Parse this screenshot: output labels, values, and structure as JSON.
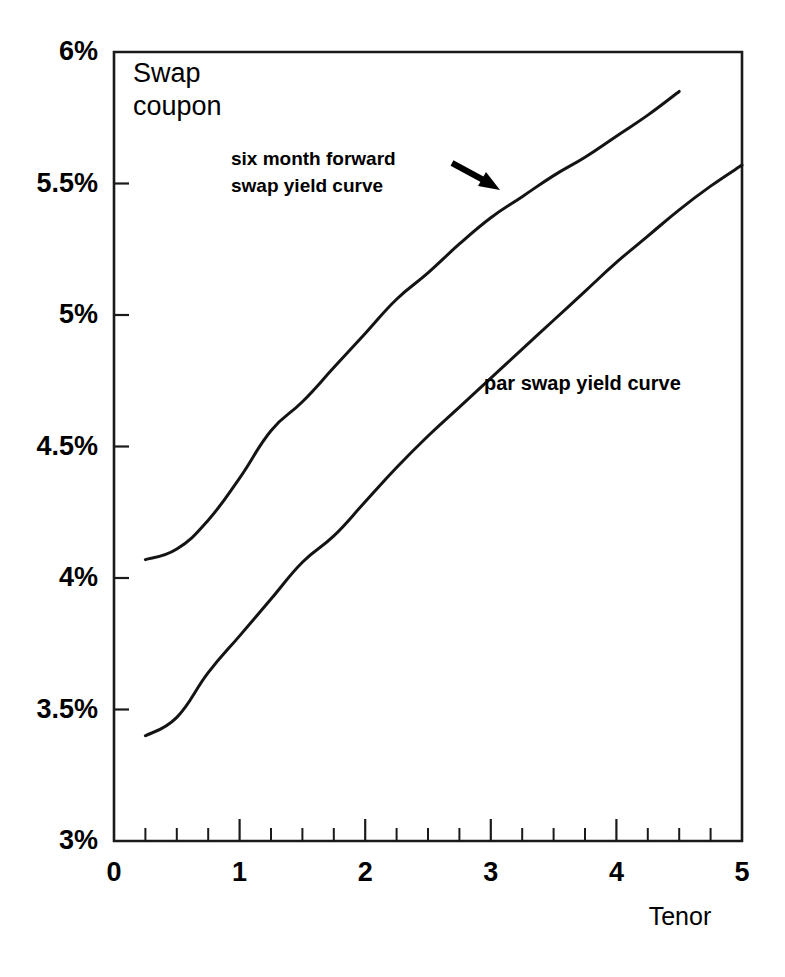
{
  "chart_data": {
    "type": "line",
    "title": "Swap coupon",
    "xlabel": "Tenor",
    "ylabel": "Swap coupon",
    "xlim": [
      0,
      5
    ],
    "ylim": [
      3,
      6
    ],
    "grid": false,
    "legend_position": "inline-annotations",
    "x_tick_labels": [
      "0",
      "1",
      "2",
      "3",
      "4",
      "5"
    ],
    "x_tick_values": [
      0,
      1,
      2,
      3,
      4,
      5
    ],
    "x_minor_tick_interval": 0.25,
    "y_tick_labels": [
      "3%",
      "3.5%",
      "4%",
      "4.5%",
      "5%",
      "5.5%",
      "6%"
    ],
    "y_tick_values": [
      3,
      3.5,
      4,
      4.5,
      5,
      5.5,
      6
    ],
    "annotations": [
      {
        "id": "forward-annotation",
        "text_lines": [
          "six month forward",
          "swap yield curve"
        ],
        "text": "six month forward swap yield curve",
        "arrow": "arrow-down-right",
        "points_to_series": "six month forward swap yield curve"
      },
      {
        "id": "par-annotation",
        "text_lines": [
          "par swap yield curve"
        ],
        "text": "par swap yield curve",
        "points_to_series": "par swap yield curve"
      }
    ],
    "series": [
      {
        "name": "six month forward swap yield curve",
        "x": [
          0.25,
          0.5,
          0.75,
          1.0,
          1.25,
          1.5,
          1.75,
          2.0,
          2.25,
          2.5,
          2.75,
          3.0,
          3.25,
          3.5,
          3.75,
          4.0,
          4.25,
          4.5
        ],
        "values": [
          4.07,
          4.11,
          4.22,
          4.38,
          4.56,
          4.67,
          4.8,
          4.93,
          5.06,
          5.16,
          5.27,
          5.37,
          5.45,
          5.53,
          5.6,
          5.68,
          5.76,
          5.85
        ]
      },
      {
        "name": "par swap yield curve",
        "x": [
          0.25,
          0.5,
          0.75,
          1.0,
          1.25,
          1.5,
          1.75,
          2.0,
          2.25,
          2.5,
          2.75,
          3.0,
          3.25,
          3.5,
          3.75,
          4.0,
          4.25,
          4.5,
          4.75,
          5.0
        ],
        "values": [
          3.4,
          3.47,
          3.64,
          3.78,
          3.92,
          4.06,
          4.16,
          4.29,
          4.42,
          4.54,
          4.65,
          4.76,
          4.87,
          4.98,
          5.09,
          5.2,
          5.3,
          5.4,
          5.49,
          5.57
        ]
      }
    ]
  },
  "colors": {
    "line": "#141414",
    "axis": "#1a1a1a",
    "background": "#ffffff"
  }
}
